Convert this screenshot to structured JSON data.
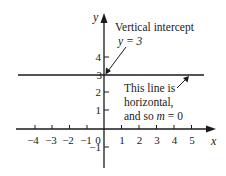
{
  "diagram": {
    "axes": {
      "x_label": "x",
      "y_label": "y",
      "x_ticks": [
        "−4",
        "−3",
        "−2",
        "−1",
        "0",
        "1",
        "2",
        "3",
        "4",
        "5"
      ],
      "y_ticks": [
        "4",
        "3",
        "2",
        "1",
        "−1"
      ]
    },
    "line": {
      "equation": "y = 3",
      "slope": "0"
    },
    "annotations": {
      "intercept_title": "Vertical intercept",
      "intercept_value": "y = 3",
      "horizontal_line1": "This line is",
      "horizontal_line2": "horizontal,",
      "horizontal_line3_prefix": "and so ",
      "horizontal_line3_var": "m",
      "horizontal_line3_suffix": " = 0"
    }
  }
}
